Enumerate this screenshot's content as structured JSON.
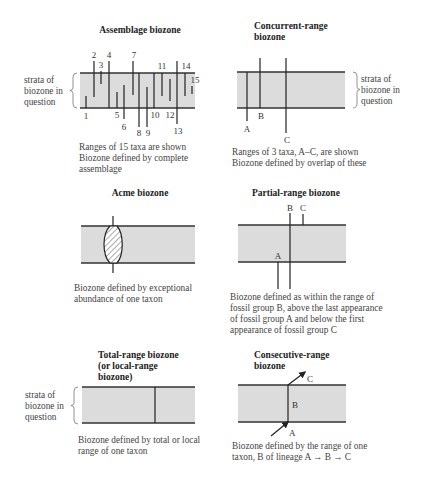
{
  "figure": {
    "colors": {
      "band_fill": "#dcdcdc",
      "line": "#222222",
      "text": "#333333"
    },
    "side_label": [
      "strata of",
      "biozone in",
      "question"
    ],
    "panels": [
      {
        "id": "assemblage",
        "title": [
          "Assemblage biozone"
        ],
        "taxa_labels": [
          "1",
          "2",
          "3",
          "4",
          "5",
          "6",
          "7",
          "8",
          "9",
          "10",
          "11",
          "12",
          "13",
          "14",
          "15"
        ],
        "caption": [
          "Ranges of 15 taxa are shown",
          "Biozone defined by complete",
          "assemblage"
        ]
      },
      {
        "id": "concurrent-range",
        "title": [
          "Concurrent-range",
          "biozone"
        ],
        "taxa_labels": [
          "A",
          "B",
          "C"
        ],
        "caption": [
          "Ranges of 3 taxa, A–C, are shown",
          "Biozone defined by overlap of these"
        ]
      },
      {
        "id": "acme",
        "title": [
          "Acme biozone"
        ],
        "caption": [
          "Biozone defined by exceptional",
          "abundance of one taxon"
        ]
      },
      {
        "id": "partial-range",
        "title": [
          "Partial-range biozone"
        ],
        "taxa_labels": [
          "A",
          "B",
          "C"
        ],
        "caption": [
          "Biozone defined as within the range of",
          "fossil group B, above the last appearance",
          "of fossil group A and below the first",
          "appearance of fossil group C"
        ]
      },
      {
        "id": "total-range",
        "title": [
          "Total-range biozone",
          "(or local-range",
          "biozone)"
        ],
        "caption": [
          "Biozone defined by total or local",
          "range of one taxon"
        ]
      },
      {
        "id": "consecutive-range",
        "title": [
          "Consecutive-range",
          "biozone"
        ],
        "taxa_labels": [
          "A",
          "B",
          "C"
        ],
        "caption": [
          "Biozone defined by the range of one",
          "taxon, B of lineage A → B → C"
        ]
      }
    ]
  }
}
